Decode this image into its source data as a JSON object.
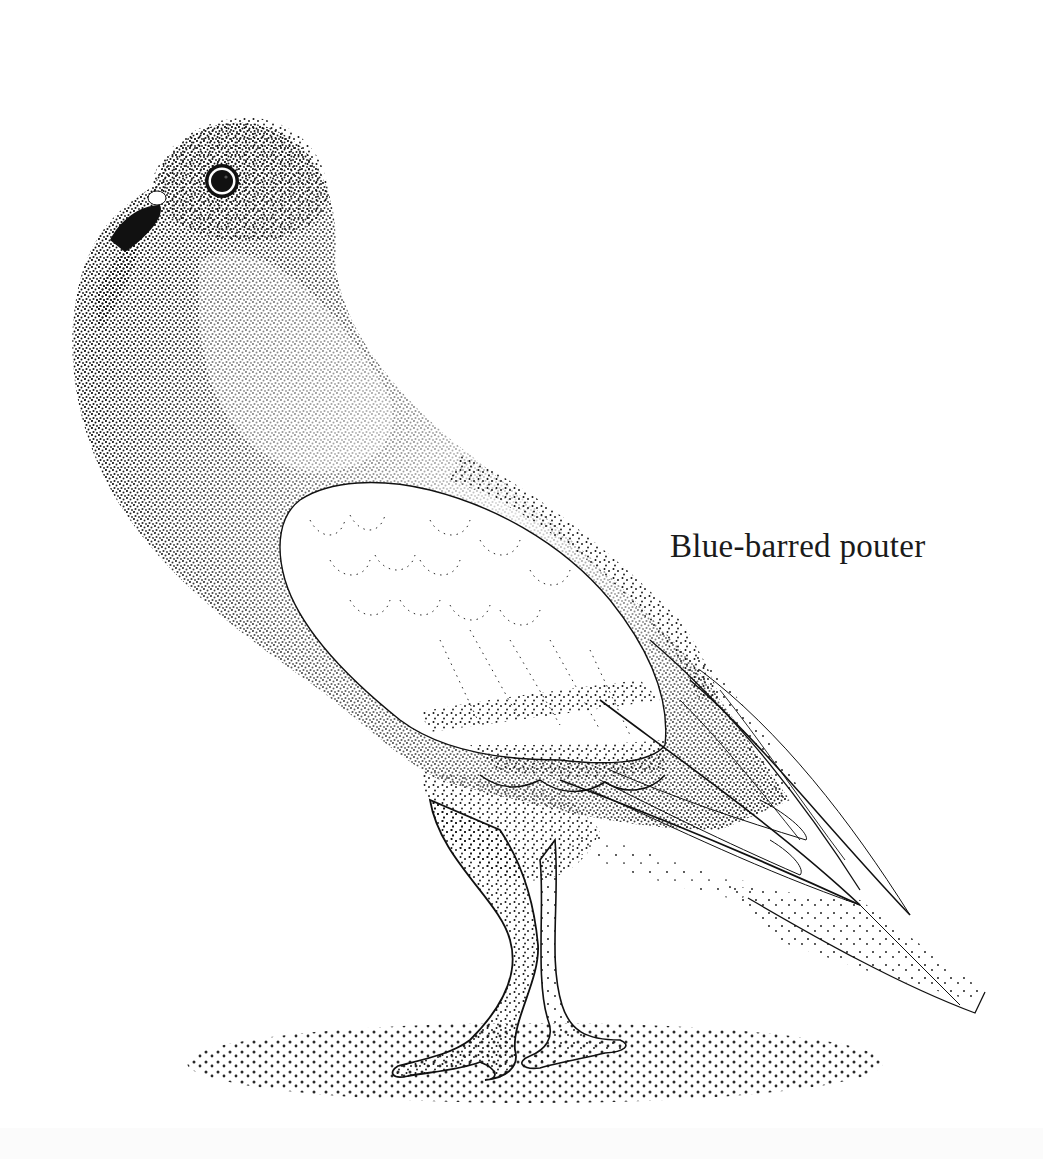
{
  "figure": {
    "caption": "Blue-barred pouter",
    "style": "stippled ink illustration"
  },
  "colors": {
    "ink": "#111111",
    "paper": "#ffffff"
  }
}
